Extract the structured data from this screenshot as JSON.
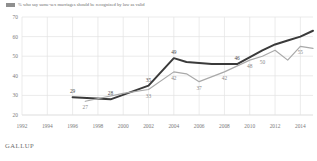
{
  "legend": {
    "marker": "line-swatch",
    "text": "% who say same-sex marriages should be recognized by law as valid"
  },
  "footer": {
    "brand": "GALLUP"
  },
  "colors": {
    "dark_line": "#3a3a3a",
    "light_line": "#a9a9a9",
    "grid": "#e3e3e3",
    "axis_text": "#7a7a7a",
    "label_dark": "#4b4b4b",
    "label_light": "#8a8a8a",
    "background": "#ffffff"
  },
  "chart_data": {
    "type": "line",
    "title": "",
    "subtitle": "",
    "xlabel": "",
    "ylabel": "",
    "xlim": [
      1992,
      2015
    ],
    "ylim": [
      20,
      70
    ],
    "yticks": [
      20,
      30,
      40,
      50,
      60,
      70
    ],
    "xticks": [
      1992,
      1994,
      1996,
      1998,
      2000,
      2002,
      2004,
      2006,
      2008,
      2010,
      2012,
      2014
    ],
    "grid": true,
    "legend_position": "top-left",
    "series": [
      {
        "name": "Support",
        "color": "#3a3a3a",
        "x": [
          1996,
          1999,
          2002,
          2004,
          2005,
          2007,
          2009,
          2011,
          2012,
          2013,
          2014,
          2015
        ],
        "values": [
          29,
          28,
          35,
          49,
          47,
          46,
          46,
          53,
          56,
          58,
          60,
          63
        ],
        "labels": [
          {
            "x": 1996,
            "y": 29,
            "text": "29"
          },
          {
            "x": 1999,
            "y": 28,
            "text": "28"
          },
          {
            "x": 2002,
            "y": 35,
            "text": "35"
          },
          {
            "x": 2004,
            "y": 49,
            "text": "49"
          },
          {
            "x": 2009,
            "y": 46,
            "text": "46"
          },
          {
            "x": 2015,
            "y": 63,
            "text": "63"
          }
        ]
      },
      {
        "name": "Opposition",
        "color": "#a9a9a9",
        "x": [
          1997,
          2000,
          2002,
          2004,
          2005,
          2006,
          2008,
          2010,
          2011,
          2012,
          2013,
          2014,
          2015
        ],
        "values": [
          27,
          31,
          33,
          42,
          41,
          37,
          42,
          48,
          50,
          53,
          48,
          55,
          54
        ],
        "labels": [
          {
            "x": 1997,
            "y": 27,
            "text": "27"
          },
          {
            "x": 2002,
            "y": 33,
            "text": "33"
          },
          {
            "x": 2004,
            "y": 42,
            "text": "42"
          },
          {
            "x": 2006,
            "y": 37,
            "text": "37"
          },
          {
            "x": 2008,
            "y": 42,
            "text": "42"
          },
          {
            "x": 2010,
            "y": 48,
            "text": "48"
          },
          {
            "x": 2011,
            "y": 50,
            "text": "50"
          },
          {
            "x": 2014,
            "y": 55,
            "text": "55"
          },
          {
            "x": 2015,
            "y": 54,
            "text": "54"
          }
        ]
      }
    ]
  }
}
